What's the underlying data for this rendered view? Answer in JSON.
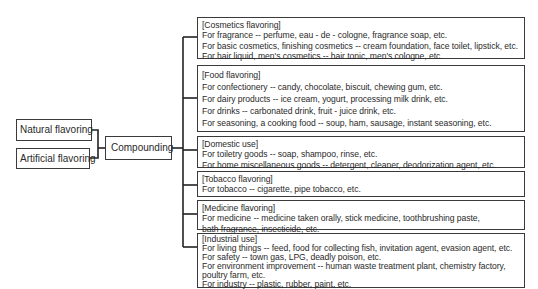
{
  "diagram": {
    "sources": [
      {
        "label": "Natural flavoring"
      },
      {
        "label": "Artificial flavoring"
      }
    ],
    "process": {
      "label": "Compounding"
    },
    "categories": [
      {
        "title": "[Cosmetics flavoring]",
        "lines": [
          "For fragrance --  perfume, eau - de - cologne, fragrance soap, etc.",
          "For basic cosmetics, finishing cosmetics -- cream foundation, face toilet, lipstick, etc.",
          "For hair liquid, men's cosmetics --  hair tonic, men's cologne, etc."
        ]
      },
      {
        "title": "[Food flavoring]",
        "lines": [
          "For confectionery -- candy, chocolate, biscuit, chewing gum, etc.",
          "For dairy products -- ice cream, yogurt, processing milk drink, etc.",
          "For drinks --  carbonated drink, fruit - juice drink, etc.",
          "For seasoning, a cooking food --  soup, ham, sausage, instant seasoning, etc."
        ]
      },
      {
        "title": "[Domestic use]",
        "lines": [
          "For toiletry goods -- soap, shampoo, rinse, etc.",
          "For home miscellaneous goods --  detergent, cleaner, deodorization agent, etc."
        ]
      },
      {
        "title": "[Tobacco flavoring]",
        "lines": [
          "For tobacco --  cigarette, pipe tobacco, etc."
        ]
      },
      {
        "title": "[Medicine flavoring]",
        "lines": [
          "For medicine -- medicine taken orally, stick medicine, toothbrushing paste,",
          "bath fragrance, insecticide, etc."
        ]
      },
      {
        "title": "[Industrial use]",
        "lines": [
          "For living things --  feed, food for collecting fish, invitation agent, evasion agent, etc.",
          "For safety -- town gas, LPG, deadly poison, etc.",
          "For environment improvement --  human waste treatment plant, chemistry factory,",
          "poultry farm, etc.",
          "For industry -- plastic, rubber, paint, etc."
        ]
      }
    ]
  }
}
